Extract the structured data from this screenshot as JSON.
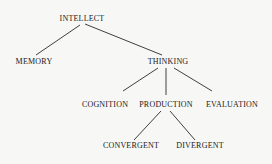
{
  "diagram": {
    "type": "tree",
    "nodes": [
      {
        "id": "intellect",
        "label": "INTELLECT",
        "x": 82,
        "y": 15
      },
      {
        "id": "memory",
        "label": "MEMORY",
        "x": 34,
        "y": 58
      },
      {
        "id": "thinking",
        "label": "THINKING",
        "x": 168,
        "y": 58
      },
      {
        "id": "cognition",
        "label": "COGNITION",
        "x": 105,
        "y": 101
      },
      {
        "id": "production",
        "label": "PRODUCTION",
        "x": 166,
        "y": 101
      },
      {
        "id": "evaluation",
        "label": "EVALUATION",
        "x": 232,
        "y": 101
      },
      {
        "id": "convergent",
        "label": "CONVERGENT",
        "x": 131,
        "y": 142
      },
      {
        "id": "divergent",
        "label": "DIVERGENT",
        "x": 200,
        "y": 142
      }
    ],
    "edges": [
      {
        "from": "intellect",
        "to": "memory"
      },
      {
        "from": "intellect",
        "to": "thinking"
      },
      {
        "from": "thinking",
        "to": "cognition"
      },
      {
        "from": "thinking",
        "to": "production"
      },
      {
        "from": "thinking",
        "to": "evaluation"
      },
      {
        "from": "production",
        "to": "convergent"
      },
      {
        "from": "production",
        "to": "divergent"
      }
    ],
    "line_color": "#2a2a2a",
    "text_color": "#1a1a1a"
  }
}
